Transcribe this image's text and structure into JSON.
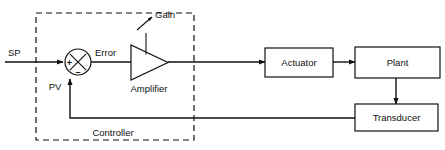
{
  "diagram": {
    "colors": {
      "ink": "#111111",
      "background": "#ffffff"
    },
    "input_label": "SP",
    "feedback_label": "PV",
    "error_label": "Error",
    "gain_label": "Gain",
    "amplifier_label": "Amplifier",
    "controller_label": "Controller",
    "summing_junction": {
      "plus_sign": "+",
      "minus_sign": "–"
    },
    "blocks": [
      {
        "id": "actuator",
        "label": "Actuator"
      },
      {
        "id": "plant",
        "label": "Plant"
      },
      {
        "id": "transducer",
        "label": "Transducer"
      }
    ]
  }
}
